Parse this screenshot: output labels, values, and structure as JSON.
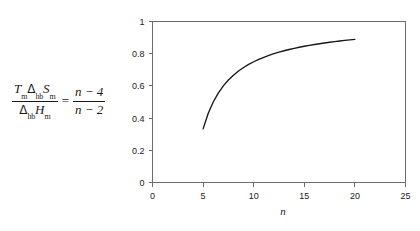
{
  "equation": {
    "lhs": {
      "numerator_parts": [
        {
          "text": "T",
          "italic": true
        },
        {
          "text": "m",
          "sub": true
        },
        {
          "text": "Δ",
          "italic": false
        },
        {
          "text": "hb",
          "sub": true
        },
        {
          "text": "S",
          "italic": true
        },
        {
          "text": "m",
          "sub": true
        }
      ],
      "denominator_parts": [
        {
          "text": "Δ",
          "italic": false
        },
        {
          "text": "hb",
          "sub": true
        },
        {
          "text": "H",
          "italic": true
        },
        {
          "text": "m",
          "sub": true
        }
      ],
      "numerator_plain": "T_m Δ_hb S_m",
      "denominator_plain": "Δ_hb H_m"
    },
    "equals": "=",
    "rhs": {
      "numerator": "n − 4",
      "denominator": "n − 2"
    },
    "plain": "T_m Δ_hb S_m / (Δ_hb H_m) = (n-4)/(n-2)"
  },
  "chart_data": {
    "type": "line",
    "title": "",
    "xlabel": "n",
    "ylabel": "",
    "xlim": [
      0,
      25
    ],
    "ylim": [
      0,
      1
    ],
    "xticks": [
      0,
      5,
      10,
      15,
      20,
      25
    ],
    "xtick_labels": [
      "0",
      "5",
      "10",
      "15",
      "20",
      "25"
    ],
    "yticks": [
      0,
      0.2,
      0.4,
      0.6,
      0.8,
      1
    ],
    "ytick_labels": [
      "0",
      "0.2",
      "0.4",
      "0.6",
      "0.8",
      "1"
    ],
    "grid": false,
    "legend": false,
    "frame": "box",
    "series": [
      {
        "name": "(n-4)/(n-2)",
        "x": [
          5,
          5.5,
          6,
          6.5,
          7,
          7.5,
          8,
          8.5,
          9,
          9.5,
          10,
          10.5,
          11,
          11.5,
          12,
          12.5,
          13,
          13.5,
          14,
          14.5,
          15,
          15.5,
          16,
          16.5,
          17,
          17.5,
          18,
          18.5,
          19,
          19.5,
          20
        ],
        "y": [
          0.333,
          0.4286,
          0.5,
          0.5556,
          0.6,
          0.6364,
          0.6667,
          0.6923,
          0.7143,
          0.7333,
          0.75,
          0.7647,
          0.7778,
          0.7895,
          0.8,
          0.8095,
          0.8182,
          0.8261,
          0.8333,
          0.84,
          0.8462,
          0.8519,
          0.8571,
          0.862,
          0.8667,
          0.871,
          0.875,
          0.8788,
          0.8824,
          0.8857,
          0.8889
        ]
      }
    ]
  }
}
